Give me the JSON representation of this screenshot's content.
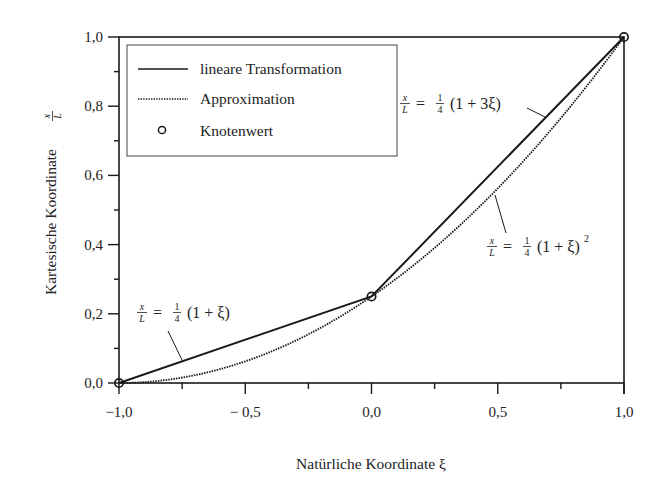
{
  "chart_data": {
    "type": "line",
    "title": "",
    "xlabel": "Natürliche Koordinate ξ",
    "ylabel": "Kartesische Koordinate x/L",
    "xlim": [
      -1.0,
      1.0
    ],
    "ylim": [
      0.0,
      1.0
    ],
    "x_ticks": [
      -1.0,
      -0.75,
      -0.5,
      -0.25,
      0.0,
      0.25,
      0.5,
      0.75,
      1.0
    ],
    "x_tick_labels": [
      "−1,0",
      "",
      "− 0,5",
      "",
      "0,0",
      "",
      "0,5",
      "",
      "1,0"
    ],
    "y_ticks": [
      0.0,
      0.1,
      0.2,
      0.3,
      0.4,
      0.5,
      0.6,
      0.7,
      0.8,
      0.9,
      1.0
    ],
    "y_tick_labels": [
      "0,0",
      "",
      "0,2",
      "",
      "0,4",
      "",
      "0,6",
      "",
      "0,8",
      "",
      "1,0"
    ],
    "grid": false,
    "legend_position": "upper left",
    "series": [
      {
        "name": "lineare Transformation",
        "style": "solid",
        "color": "#1a1a1a",
        "x": [
          -1.0,
          0.0,
          1.0
        ],
        "y": [
          0.0,
          0.25,
          1.0
        ]
      },
      {
        "name": "Approximation",
        "style": "dotted",
        "color": "#1a1a1a",
        "formula": "x/L = 1/4 (1+ξ)^2",
        "x": [
          -1.0,
          -0.75,
          -0.5,
          -0.25,
          0.0,
          0.25,
          0.5,
          0.75,
          1.0
        ],
        "y": [
          0.0,
          0.015625,
          0.0625,
          0.140625,
          0.25,
          0.390625,
          0.5625,
          0.765625,
          1.0
        ]
      },
      {
        "name": "Knotenwert",
        "style": "marker-circle",
        "color": "#1a1a1a",
        "x": [
          -1.0,
          0.0,
          1.0
        ],
        "y": [
          0.0,
          0.25,
          1.0
        ]
      }
    ],
    "annotations": [
      {
        "text": "x/L = 1/4 (1 + ξ)",
        "target": "lineare Transformation, ξ∈[-1,0]"
      },
      {
        "text": "x/L = 1/4 (1 + 3ξ)",
        "target": "lineare Transformation, ξ∈[0,1]"
      },
      {
        "text": "x/L = 1/4 (1 + ξ)^2",
        "target": "Approximation"
      }
    ]
  },
  "labels": {
    "xlabel": "Natürliche Koordinate ξ",
    "ylabel_prefix": "Kartesische Koordinate",
    "ylabel_frac_num": "x",
    "ylabel_frac_den": "L",
    "legend": [
      "lineare Transformation",
      "Approximation",
      "Knotenwert"
    ],
    "anno1": {
      "num": "x",
      "den": "L",
      "eq": "=",
      "one": "1",
      "four": "4",
      "rest": "(1 + ξ)"
    },
    "anno2": {
      "num": "x",
      "den": "L",
      "eq": "=",
      "one": "1",
      "four": "4",
      "rest": "(1 + 3ξ)"
    },
    "anno3": {
      "num": "x",
      "den": "L",
      "eq": "=",
      "one": "1",
      "four": "4",
      "rest": "(1 + ξ)",
      "sup": "2"
    }
  }
}
